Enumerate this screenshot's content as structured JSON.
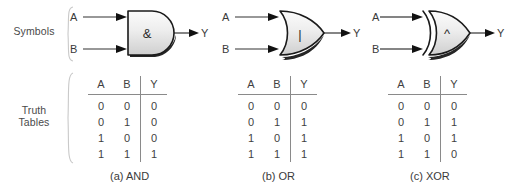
{
  "figure": {
    "row_labels": {
      "symbols": "Symbols",
      "truth_tables_line1": "Truth",
      "truth_tables_line2": "Tables"
    },
    "pin_labels": {
      "input_a": "A",
      "input_b": "B",
      "output_y": "Y"
    },
    "table_headers": {
      "a": "A",
      "b": "B",
      "y": "Y"
    },
    "colors": {
      "gate_fill_light": "#f2f2f2",
      "gate_fill_dark": "#d6d6d6",
      "gate_outline": "#1a1a1a",
      "gate_shadow": "#000000",
      "brace": "#c9c9c9",
      "text": "#3a3a3a",
      "rule": "#8a8a8a",
      "background": "#ffffff"
    },
    "gates": [
      {
        "id": "and",
        "name": "AND",
        "caption": "(a) AND",
        "symbol_glyph": "&",
        "symbol_icon": "ampersand-icon",
        "shape": "rectangular-left-rounded-right",
        "truth_table": {
          "columns": [
            "A",
            "B",
            "Y"
          ],
          "rows": [
            [
              "0",
              "0",
              "0"
            ],
            [
              "0",
              "1",
              "0"
            ],
            [
              "1",
              "0",
              "0"
            ],
            [
              "1",
              "1",
              "1"
            ]
          ]
        }
      },
      {
        "id": "or",
        "name": "OR",
        "caption": "(b) OR",
        "symbol_glyph": "|",
        "symbol_icon": "vertical-bar-icon",
        "shape": "concave-left-pointed-right",
        "truth_table": {
          "columns": [
            "A",
            "B",
            "Y"
          ],
          "rows": [
            [
              "0",
              "0",
              "0"
            ],
            [
              "0",
              "1",
              "1"
            ],
            [
              "1",
              "0",
              "1"
            ],
            [
              "1",
              "1",
              "1"
            ]
          ]
        }
      },
      {
        "id": "xor",
        "name": "XOR",
        "caption": "(c) XOR",
        "symbol_glyph": "^",
        "symbol_icon": "caret-icon",
        "shape": "double-concave-left-pointed-right",
        "truth_table": {
          "columns": [
            "A",
            "B",
            "Y"
          ],
          "rows": [
            [
              "0",
              "0",
              "0"
            ],
            [
              "0",
              "1",
              "1"
            ],
            [
              "1",
              "0",
              "1"
            ],
            [
              "1",
              "1",
              "0"
            ]
          ]
        }
      }
    ]
  }
}
